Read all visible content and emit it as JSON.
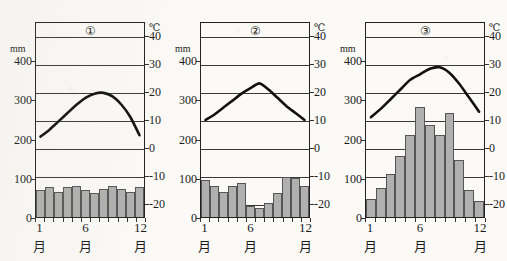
{
  "page": {
    "top_text": "",
    "background_color": "#fbfaf7",
    "ink_color": "#111111",
    "bar_fill_color": "#b0b0b0",
    "bar_stroke_color": "#555555"
  },
  "axes": {
    "left_unit": "mm",
    "right_unit": "℃",
    "precip_ticks": [
      "400",
      "300",
      "200",
      "100",
      "0"
    ],
    "precip_tick_values": [
      400,
      300,
      200,
      100,
      0
    ],
    "temp_ticks": [
      "40",
      "30",
      "20",
      "10",
      "0",
      "-10",
      "-20"
    ],
    "temp_tick_values": [
      40,
      30,
      20,
      10,
      0,
      -10,
      -20
    ],
    "month_label": "月",
    "month_ticks": [
      "1",
      "6",
      "12"
    ],
    "month_tick_values": [
      1,
      6,
      12
    ],
    "precip_range": [
      0,
      500
    ],
    "temp_range": [
      -25,
      45
    ]
  },
  "chart_data": [
    {
      "type": "bar",
      "id": "chart-1",
      "title": "①",
      "categories": [
        1,
        2,
        3,
        4,
        5,
        6,
        7,
        8,
        9,
        10,
        11,
        12
      ],
      "xlabel": "月",
      "ylabel": "mm",
      "ylim": [
        0,
        500
      ],
      "y2label": "℃",
      "y2lim": [
        -25,
        45
      ],
      "grid": true,
      "legend": "none",
      "series": [
        {
          "name": "precipitation",
          "type": "bar",
          "unit": "mm",
          "values": [
            68,
            76,
            63,
            76,
            80,
            70,
            60,
            72,
            78,
            71,
            64,
            77
          ]
        },
        {
          "name": "temperature",
          "type": "line",
          "unit": "℃",
          "values": [
            4.0,
            6.5,
            9.5,
            12.5,
            15.5,
            18.0,
            19.5,
            19.8,
            18.5,
            15.5,
            11.0,
            4.5
          ]
        }
      ]
    },
    {
      "type": "bar",
      "id": "chart-2",
      "title": "②",
      "categories": [
        1,
        2,
        3,
        4,
        5,
        6,
        7,
        8,
        9,
        10,
        11,
        12
      ],
      "xlabel": "月",
      "ylabel": "mm",
      "ylim": [
        0,
        500
      ],
      "y2label": "℃",
      "y2lim": [
        -25,
        45
      ],
      "grid": true,
      "legend": "none",
      "series": [
        {
          "name": "precipitation",
          "type": "bar",
          "unit": "mm",
          "values": [
            95,
            80,
            65,
            78,
            88,
            28,
            22,
            35,
            60,
            103,
            100,
            78
          ]
        },
        {
          "name": "temperature",
          "type": "line",
          "unit": "℃",
          "values": [
            10.0,
            12.0,
            14.5,
            17.0,
            19.5,
            21.5,
            23.2,
            21.0,
            18.0,
            15.0,
            12.5,
            10.0
          ]
        }
      ]
    },
    {
      "type": "bar",
      "id": "chart-3",
      "title": "③",
      "categories": [
        1,
        2,
        3,
        4,
        5,
        6,
        7,
        8,
        9,
        10,
        11,
        12
      ],
      "xlabel": "月",
      "ylabel": "mm",
      "ylim": [
        0,
        500
      ],
      "y2label": "℃",
      "y2lim": [
        -25,
        45
      ],
      "grid": true,
      "legend": "none",
      "series": [
        {
          "name": "precipitation",
          "type": "bar",
          "unit": "mm",
          "values": [
            45,
            75,
            110,
            155,
            210,
            280,
            235,
            210,
            265,
            145,
            70,
            40
          ]
        },
        {
          "name": "temperature",
          "type": "line",
          "unit": "℃",
          "values": [
            11.0,
            14.0,
            17.5,
            21.0,
            24.5,
            26.5,
            28.5,
            29.0,
            27.0,
            23.0,
            18.0,
            13.0
          ]
        }
      ]
    }
  ]
}
